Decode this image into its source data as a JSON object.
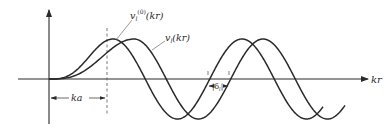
{
  "diagram": {
    "type": "phase-shift-plot",
    "axes": {
      "x_label": "kr",
      "y_label": ""
    },
    "curves": [
      {
        "id": "free",
        "label_main": "v",
        "label_sub": "l",
        "label_sup": "(0)",
        "label_arg": "(kr)"
      },
      {
        "id": "scattered",
        "label_main": "v",
        "label_sub": "l",
        "label_sup": "",
        "label_arg": "(kr)"
      }
    ],
    "annotations": {
      "range_label": "ka",
      "phase_shift_label_main": "|δ",
      "phase_shift_label_sub": "l",
      "phase_shift_label_end": "|"
    },
    "colors": {
      "ink": "#2a2a2a",
      "background": "#ffffff"
    }
  }
}
